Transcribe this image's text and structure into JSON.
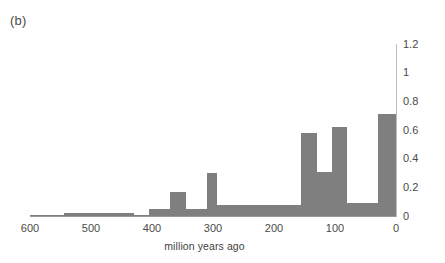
{
  "figure": {
    "panel_label": "(b)",
    "bar_color": "#7f7f7f",
    "axis_color": "#9a9a9a",
    "text_color": "#4a4a4a"
  },
  "chart_data": {
    "type": "bar",
    "title": "(b)",
    "xlabel": "million years ago",
    "ylabel": "",
    "xlim": [
      600,
      0
    ],
    "ylim": [
      0,
      1.2
    ],
    "x_axis_reversed": true,
    "y_axis_position": "right",
    "grid": false,
    "legend": null,
    "xticks": [
      600,
      500,
      400,
      300,
      200,
      100,
      0
    ],
    "xtick_labels": [
      "600",
      "500",
      "400",
      "300",
      "200",
      "100",
      "0"
    ],
    "yticks": [
      0,
      0.2,
      0.4,
      0.6,
      0.8,
      1,
      1.2
    ],
    "ytick_labels": [
      "0",
      "0.2",
      "0.4",
      "0.6",
      "0.8",
      "1",
      "1.2"
    ],
    "bins": [
      {
        "start": 600,
        "end": 545,
        "value": 0.005
      },
      {
        "start": 545,
        "end": 430,
        "value": 0.02
      },
      {
        "start": 430,
        "end": 405,
        "value": 0.005
      },
      {
        "start": 405,
        "end": 370,
        "value": 0.05
      },
      {
        "start": 370,
        "end": 345,
        "value": 0.17
      },
      {
        "start": 345,
        "end": 310,
        "value": 0.05
      },
      {
        "start": 310,
        "end": 293,
        "value": 0.3
      },
      {
        "start": 293,
        "end": 155,
        "value": 0.08
      },
      {
        "start": 155,
        "end": 130,
        "value": 0.58
      },
      {
        "start": 130,
        "end": 105,
        "value": 0.31
      },
      {
        "start": 105,
        "end": 80,
        "value": 0.62
      },
      {
        "start": 80,
        "end": 30,
        "value": 0.09
      },
      {
        "start": 30,
        "end": 0,
        "value": 0.71
      }
    ]
  }
}
